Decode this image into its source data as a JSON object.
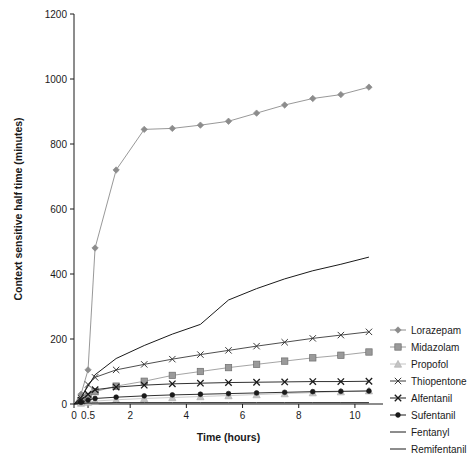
{
  "chart_data": {
    "type": "line",
    "title": "",
    "xlabel": "Time (hours)",
    "ylabel": "Context sensitive half time (minutes)",
    "xlim": [
      0,
      11
    ],
    "ylim": [
      0,
      1200
    ],
    "xticks": [
      0,
      2,
      4,
      6,
      8,
      10
    ],
    "xtick_labels": [
      "0",
      "2",
      "4",
      "6",
      "8",
      "10"
    ],
    "extra_xticks": [
      0.5
    ],
    "extra_xtick_labels": [
      "0.5"
    ],
    "yticks": [
      0,
      200,
      400,
      600,
      800,
      1000,
      1200
    ],
    "ytick_labels": [
      "0",
      "200",
      "400",
      "600",
      "800",
      "1000",
      "1200"
    ],
    "grid": false,
    "legend_position": "right",
    "x": [
      0,
      0.25,
      0.5,
      0.75,
      1.5,
      2.5,
      3.5,
      4.5,
      5.5,
      6.5,
      7.5,
      8.5,
      9.5,
      10.5
    ],
    "series": [
      {
        "name": "Lorazepam",
        "marker": "diamond",
        "color": "#8c8c8c",
        "values": [
          0,
          30,
          105,
          480,
          720,
          845,
          848,
          858,
          870,
          895,
          920,
          940,
          952,
          975
        ]
      },
      {
        "name": "Midazolam",
        "marker": "square",
        "color": "#9a9a9a",
        "values": [
          0,
          10,
          22,
          38,
          55,
          70,
          88,
          100,
          112,
          122,
          132,
          142,
          150,
          160
        ]
      },
      {
        "name": "Propofol",
        "marker": "triangle",
        "color": "#c4c4c4",
        "values": [
          0,
          3,
          6,
          9,
          13,
          17,
          20,
          23,
          26,
          29,
          32,
          35,
          38,
          41
        ]
      },
      {
        "name": "Thiopentone",
        "marker": "x",
        "color": "#3a3a3a",
        "values": [
          0,
          18,
          60,
          82,
          105,
          122,
          138,
          152,
          165,
          178,
          190,
          202,
          212,
          222
        ]
      },
      {
        "name": "Alfentanil",
        "marker": "x-bold",
        "color": "#1a1a1a",
        "values": [
          0,
          12,
          30,
          44,
          52,
          58,
          62,
          64,
          66,
          67,
          68,
          69,
          69,
          70
        ]
      },
      {
        "name": "Sufentanil",
        "marker": "circle",
        "color": "#1a1a1a",
        "values": [
          0,
          5,
          12,
          17,
          21,
          25,
          28,
          30,
          32,
          34,
          36,
          38,
          39,
          40
        ]
      },
      {
        "name": "Fentanyl",
        "marker": "none",
        "color": "#1a1a1a",
        "values": [
          0,
          20,
          55,
          90,
          140,
          180,
          215,
          245,
          320,
          355,
          385,
          410,
          430,
          452
        ]
      },
      {
        "name": "Remifentanil",
        "marker": "none",
        "color": "#1a1a1a",
        "values": [
          0,
          2,
          3,
          3,
          4,
          4,
          4,
          4,
          4,
          4,
          4,
          4,
          4,
          4
        ]
      }
    ]
  },
  "legend": {
    "items": [
      {
        "label": "Lorazepam"
      },
      {
        "label": "Midazolam"
      },
      {
        "label": "Propofol"
      },
      {
        "label": "Thiopentone"
      },
      {
        "label": "Alfentanil"
      },
      {
        "label": "Sufentanil"
      },
      {
        "label": "Fentanyl"
      },
      {
        "label": "Remifentanil"
      }
    ]
  }
}
